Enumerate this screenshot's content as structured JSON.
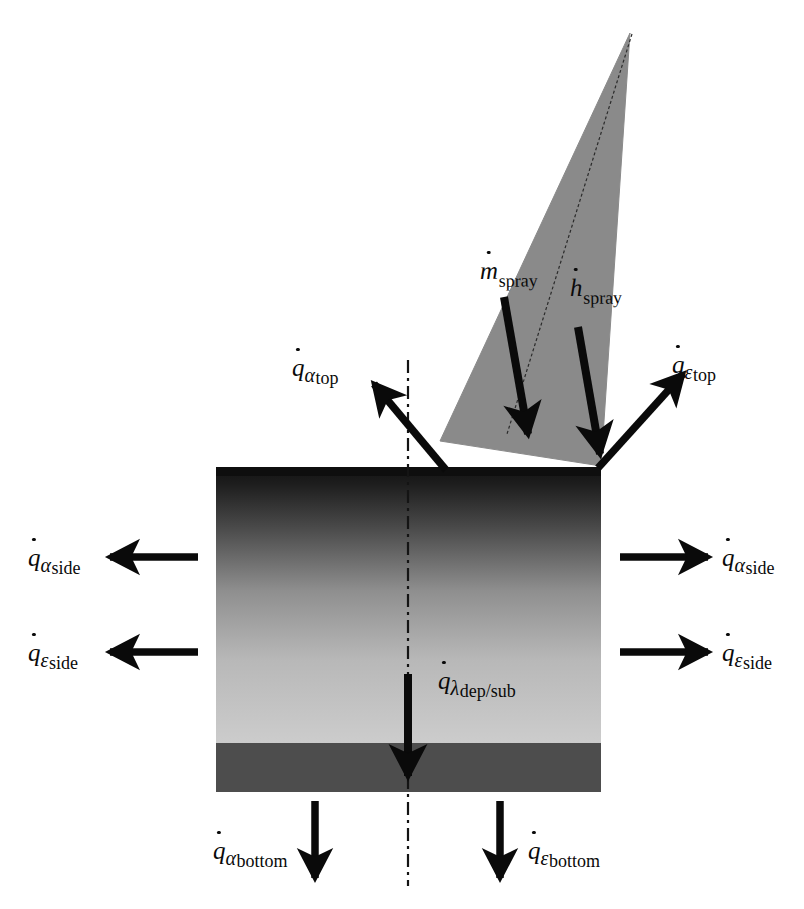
{
  "diagram": {
    "type": "schematic-cross-section",
    "colors": {
      "spray_cone_fill": "#8a8a8a",
      "deposit_top": "#1c1c1c",
      "deposit_bottom": "#c9c9c9",
      "substrate_fill": "#4a4a4a",
      "arrow": "#0a0a0a",
      "centerline": "#1a1a1a",
      "background": "#ffffff"
    },
    "centerline": {
      "style": "dash-dot",
      "orientation": "vertical",
      "label": "axis-of-symmetry"
    },
    "spray": {
      "shape": "cone",
      "apex_label": "spray-gun-apex",
      "flux_labels": [
        {
          "id": "m_spray",
          "symbol": "m",
          "dot": true,
          "subscript": "spray",
          "subscript_style": "roman",
          "description": "spray mass flow rate"
        },
        {
          "id": "h_spray",
          "symbol": "h",
          "dot": true,
          "subscript": "spray",
          "subscript_style": "roman",
          "description": "spray enthalpy flow rate"
        }
      ]
    },
    "body": {
      "deposit_label": "deposit-layer",
      "substrate_label": "substrate-layer"
    },
    "heat_fluxes": [
      {
        "id": "q_alpha_top",
        "symbol": "q",
        "dot": true,
        "greek": "α",
        "subscript": "top",
        "direction": "up-left",
        "description": "convective heat loss from top surface"
      },
      {
        "id": "q_eps_top",
        "symbol": "q",
        "dot": true,
        "greek": "ε",
        "subscript": "top",
        "direction": "up-right",
        "description": "radiative heat loss from top surface"
      },
      {
        "id": "q_alpha_side_l",
        "symbol": "q",
        "dot": true,
        "greek": "α",
        "subscript": "side",
        "direction": "left",
        "description": "convective heat loss from left side"
      },
      {
        "id": "q_eps_side_l",
        "symbol": "q",
        "dot": true,
        "greek": "ε",
        "subscript": "side",
        "direction": "left",
        "description": "radiative heat loss from left side"
      },
      {
        "id": "q_alpha_side_r",
        "symbol": "q",
        "dot": true,
        "greek": "α",
        "subscript": "side",
        "direction": "right",
        "description": "convective heat loss from right side"
      },
      {
        "id": "q_eps_side_r",
        "symbol": "q",
        "dot": true,
        "greek": "ε",
        "subscript": "side",
        "direction": "right",
        "description": "radiative heat loss from right side"
      },
      {
        "id": "q_lambda_dep_sub",
        "symbol": "q",
        "dot": true,
        "greek": "λ",
        "subscript": "dep/sub",
        "direction": "down",
        "description": "conductive heat flow deposit to substrate"
      },
      {
        "id": "q_alpha_bottom",
        "symbol": "q",
        "dot": true,
        "greek": "α",
        "subscript": "bottom",
        "direction": "down",
        "description": "convective heat loss from bottom surface"
      },
      {
        "id": "q_eps_bottom",
        "symbol": "q",
        "dot": true,
        "greek": "ε",
        "subscript": "bottom",
        "direction": "down",
        "description": "radiative heat loss from bottom surface"
      }
    ],
    "labels": {
      "q_alpha_top": {
        "sym": "q",
        "greek": "α",
        "sub": "top"
      },
      "q_eps_top": {
        "sym": "q",
        "greek": "ε",
        "sub": "top"
      },
      "q_alpha_side_l": {
        "sym": "q",
        "greek": "α",
        "sub": "side"
      },
      "q_eps_side_l": {
        "sym": "q",
        "greek": "ε",
        "sub": "side"
      },
      "q_alpha_side_r": {
        "sym": "q",
        "greek": "α",
        "sub": "side"
      },
      "q_eps_side_r": {
        "sym": "q",
        "greek": "ε",
        "sub": "side"
      },
      "q_lambda_dep_sub": {
        "sym": "q",
        "greek": "λ",
        "sub": "dep/sub"
      },
      "q_alpha_bottom": {
        "sym": "q",
        "greek": "α",
        "sub": "bottom"
      },
      "q_eps_bottom": {
        "sym": "q",
        "greek": "ε",
        "sub": "bottom"
      },
      "m_spray": {
        "sym": "m",
        "greek": "",
        "sub": "spray"
      },
      "h_spray": {
        "sym": "h",
        "greek": "",
        "sub": "spray"
      }
    }
  }
}
